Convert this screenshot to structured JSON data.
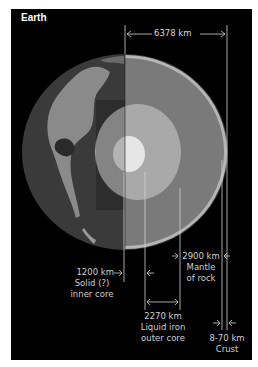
{
  "title": "Earth",
  "measurements": {
    "radius": {
      "value": "6378 km"
    },
    "inner_core": {
      "value": "1200 km",
      "line1": "Solid (?)",
      "line2": "inner core"
    },
    "outer_core": {
      "value": "2270 km",
      "line1": "Liquid iron",
      "line2": "outer core"
    },
    "mantle": {
      "value": "2900 km",
      "line1": "Mantle",
      "line2": "of rock"
    },
    "crust": {
      "value": "8-70 km",
      "line1": "Crust"
    }
  },
  "colors": {
    "background": "#000000",
    "globe_dark": "#3a3a3a",
    "land": "#8a8a8a",
    "mantle": "#7a7a7a",
    "outer_core": "#a9a9a9",
    "inner_core": "#e6e6e6",
    "crust": "#b5b5b5",
    "lines": "#d0d0d0"
  }
}
